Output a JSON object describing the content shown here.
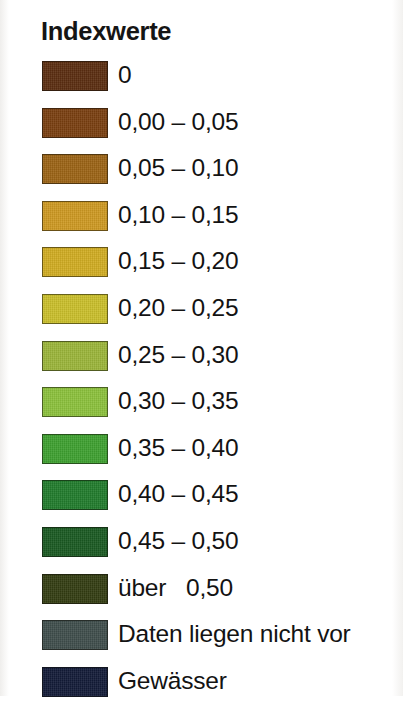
{
  "legend": {
    "title": "Indexwerte",
    "entries": [
      {
        "label": "0",
        "color": "#5b2d10"
      },
      {
        "label": "0,00 – 0,05",
        "color": "#7a3f10"
      },
      {
        "label": "0,05 – 0,10",
        "color": "#9c6415"
      },
      {
        "label": "0,10 – 0,15",
        "color": "#cf9a22"
      },
      {
        "label": "0,15 – 0,20",
        "color": "#d2ad22"
      },
      {
        "label": "0,20 – 0,25",
        "color": "#cbc02b"
      },
      {
        "label": "0,25 – 0,30",
        "color": "#9cb63a"
      },
      {
        "label": "0,30 – 0,35",
        "color": "#8cc23c"
      },
      {
        "label": "0,35 – 0,40",
        "color": "#3ea130"
      },
      {
        "label": "0,40 – 0,45",
        "color": "#217c2c"
      },
      {
        "label": "0,45 – 0,50",
        "color": "#1a5a22"
      },
      {
        "label": "über   0,50",
        "color": "#343d12"
      },
      {
        "label": "Daten liegen nicht vor",
        "color": "#3f4e4c"
      },
      {
        "label": "Gewässer",
        "color": "#131b38"
      }
    ]
  },
  "chart_data": {
    "type": "table",
    "title": "Indexwerte",
    "xlabel": "",
    "ylabel": "",
    "legend_position": "left",
    "categories": [
      "0",
      "0,00 – 0,05",
      "0,05 – 0,10",
      "0,10 – 0,15",
      "0,15 – 0,20",
      "0,20 – 0,25",
      "0,25 – 0,30",
      "0,30 – 0,35",
      "0,35 – 0,40",
      "0,40 – 0,45",
      "0,45 – 0,50",
      "über   0,50",
      "Daten liegen nicht vor",
      "Gewässer"
    ],
    "colors": [
      "#5b2d10",
      "#7a3f10",
      "#9c6415",
      "#cf9a22",
      "#d2ad22",
      "#cbc02b",
      "#9cb63a",
      "#8cc23c",
      "#3ea130",
      "#217c2c",
      "#1a5a22",
      "#343d12",
      "#3f4e4c",
      "#131b38"
    ],
    "bin_edges": [
      0.0,
      0.05,
      0.1,
      0.15,
      0.2,
      0.25,
      0.3,
      0.35,
      0.4,
      0.45,
      0.5
    ],
    "special_categories": [
      "Daten liegen nicht vor",
      "Gewässer"
    ]
  }
}
